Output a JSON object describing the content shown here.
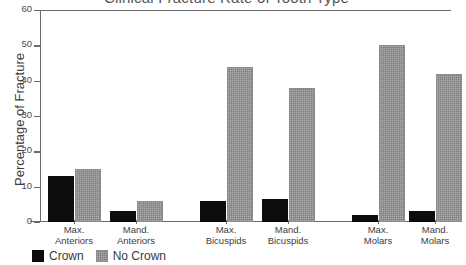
{
  "chart_data": {
    "type": "bar",
    "title": "Clinical Fracture Rate of Tooth Type",
    "xlabel": "",
    "ylabel": "Percentage of Fracture",
    "categories": [
      "Max. Anteriors",
      "Mand. Anteriors",
      "Max. Bicuspids",
      "Mand. Bicuspids",
      "Max. Molars",
      "Mand. Molars"
    ],
    "category_lines": [
      [
        "Max.",
        "Anteriors"
      ],
      [
        "Mand.",
        "Anteriors"
      ],
      [
        "Max.",
        "Bicuspids"
      ],
      [
        "Mand.",
        "Bicuspids"
      ],
      [
        "Max.",
        "Molars"
      ],
      [
        "Mand.",
        "Molars"
      ]
    ],
    "series": [
      {
        "name": "Crown",
        "color": "#0d0d0d",
        "values": [
          13,
          3,
          6,
          6.5,
          2,
          3
        ]
      },
      {
        "name": "No Crown",
        "color": "#808080",
        "values": [
          15,
          6,
          44,
          38,
          50,
          42
        ]
      }
    ],
    "ylim": [
      0,
      60
    ],
    "yticks": [
      0,
      10,
      20,
      30,
      40,
      50,
      60
    ],
    "ytick_labels": [
      "0",
      "10",
      "20",
      "30",
      "40",
      "50",
      "60"
    ],
    "grid": false,
    "legend_position": "bottom-left"
  },
  "legend": {
    "items": [
      {
        "label": "Crown",
        "swatch": "crown"
      },
      {
        "label": "No Crown",
        "swatch": "nocrown"
      }
    ]
  }
}
